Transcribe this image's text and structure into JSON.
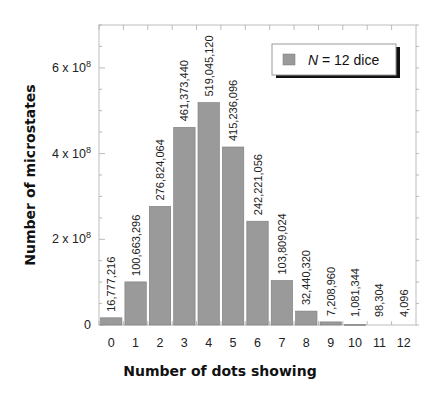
{
  "chart_data": {
    "type": "bar",
    "title": "",
    "xlabel": "Number of dots showing",
    "ylabel": "Number of microstates",
    "categories": [
      "0",
      "1",
      "2",
      "3",
      "4",
      "5",
      "6",
      "7",
      "8",
      "9",
      "10",
      "11",
      "12"
    ],
    "values": [
      16777216,
      100663296,
      276824064,
      461373440,
      519045120,
      415236096,
      242221056,
      103809024,
      32440320,
      7208960,
      1081344,
      98304,
      4096
    ],
    "value_labels": [
      "16,777,216",
      "100,663,296",
      "276,824,064",
      "461,373,440",
      "519,045,120",
      "415,236,096",
      "242,221,056",
      "103,809,024",
      "32,440,320",
      "7,208,960",
      "1,081,344",
      "98,304",
      "4,096"
    ],
    "series": [
      {
        "name": "N = 12 dice",
        "values": [
          16777216,
          100663296,
          276824064,
          461373440,
          519045120,
          415236096,
          242221056,
          103809024,
          32440320,
          7208960,
          1081344,
          98304,
          4096
        ]
      }
    ],
    "ylim": [
      0,
      700000000
    ],
    "yticks": [
      0,
      200000000,
      400000000,
      600000000
    ],
    "ytick_labels": [
      "0",
      "2 x 10^8",
      "4 x 10^8",
      "6 x 10^8"
    ],
    "grid": false,
    "legend_position": "upper right",
    "bar_color": "#9a9a9a"
  },
  "legend": {
    "var": "N",
    "rest": " = 12 dice"
  },
  "axes": {
    "xlabel": "Number of dots showing",
    "ylabel": "Number of microstates"
  }
}
